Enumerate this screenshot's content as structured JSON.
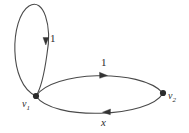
{
  "figure": {
    "type": "directed-multigraph",
    "background_color": "#ffffff",
    "stroke_color": "#4a4a4a",
    "node_color": "#2b2b2b",
    "text_color": "#2b2b2b",
    "width": 189,
    "height": 133
  },
  "vertices": [
    {
      "id": "v1",
      "label": "v",
      "subscript": "1",
      "x": 36,
      "y": 96
    },
    {
      "id": "v2",
      "label": "v",
      "subscript": "2",
      "x": 163,
      "y": 93
    }
  ],
  "edges": [
    {
      "id": "self-loop",
      "from": "v1",
      "to": "v1",
      "label": "1",
      "italic": false,
      "arrow_direction": "down",
      "label_x": 50,
      "label_y": 33
    },
    {
      "id": "top-edge",
      "from": "v1",
      "to": "v2",
      "label": "1",
      "italic": false,
      "arrow_direction": "right",
      "label_x": 101,
      "label_y": 57
    },
    {
      "id": "bottom-edge",
      "from": "v2",
      "to": "v1",
      "label": "x",
      "italic": true,
      "arrow_direction": "left",
      "label_x": 101,
      "label_y": 117
    }
  ]
}
